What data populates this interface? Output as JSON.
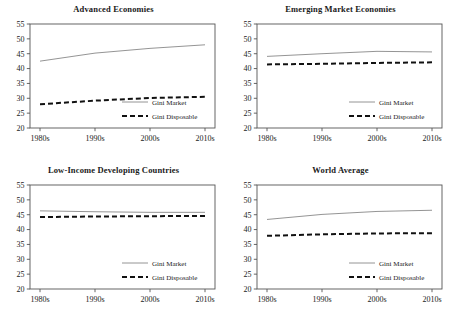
{
  "figure": {
    "panel_order": [
      "advanced",
      "emerging",
      "lowincome",
      "world"
    ]
  },
  "chart_data": [
    {
      "type": "line",
      "title": "Advanced Economies",
      "xlabel": "",
      "ylabel": "",
      "categories": [
        "1980s",
        "1990s",
        "2000s",
        "2010s"
      ],
      "x_tick_labels": [
        "1980s",
        "1990s",
        "2000s",
        "2010s"
      ],
      "y_tick_labels": [
        "20",
        "25",
        "30",
        "35",
        "40",
        "45",
        "50",
        "55"
      ],
      "ylim": [
        20,
        55
      ],
      "y_tick_step": 5,
      "grid": false,
      "legend_position": "lower-right-inside",
      "series": [
        {
          "name": "Gini Market",
          "style": "solid",
          "color": "#888888",
          "values": [
            42.5,
            45.2,
            46.8,
            48.0
          ]
        },
        {
          "name": "Gini Disposable",
          "style": "dashed",
          "color": "#111111",
          "values": [
            28.0,
            29.2,
            30.1,
            30.5
          ]
        }
      ]
    },
    {
      "type": "line",
      "title": "Emerging Market Economies",
      "xlabel": "",
      "ylabel": "",
      "categories": [
        "1980s",
        "1990s",
        "2000s",
        "2010s"
      ],
      "x_tick_labels": [
        "1980s",
        "1990s",
        "2000s",
        "2010s"
      ],
      "y_tick_labels": [
        "20",
        "25",
        "30",
        "35",
        "40",
        "45",
        "50",
        "55"
      ],
      "ylim": [
        20,
        55
      ],
      "y_tick_step": 5,
      "grid": false,
      "legend_position": "lower-right-inside",
      "series": [
        {
          "name": "Gini Market",
          "style": "solid",
          "color": "#888888",
          "values": [
            44.1,
            45.0,
            45.8,
            45.6
          ]
        },
        {
          "name": "Gini Disposable",
          "style": "dashed",
          "color": "#111111",
          "values": [
            41.4,
            41.6,
            41.9,
            42.1
          ]
        }
      ]
    },
    {
      "type": "line",
      "title": "Low-Income Developing Countries",
      "xlabel": "",
      "ylabel": "",
      "categories": [
        "1980s",
        "1990s",
        "2000s",
        "2010s"
      ],
      "x_tick_labels": [
        "1980s",
        "1990s",
        "2000s",
        "2010s"
      ],
      "y_tick_labels": [
        "20",
        "25",
        "30",
        "35",
        "40",
        "45",
        "50",
        "55"
      ],
      "ylim": [
        20,
        55
      ],
      "y_tick_step": 5,
      "grid": false,
      "legend_position": "lower-right-inside",
      "series": [
        {
          "name": "Gini Market",
          "style": "solid",
          "color": "#888888",
          "values": [
            46.3,
            46.0,
            45.8,
            45.8
          ]
        },
        {
          "name": "Gini Disposable",
          "style": "dashed",
          "color": "#111111",
          "values": [
            44.2,
            44.4,
            44.5,
            44.6
          ]
        }
      ]
    },
    {
      "type": "line",
      "title": "World Average",
      "xlabel": "",
      "ylabel": "",
      "categories": [
        "1980s",
        "1990s",
        "2000s",
        "2010s"
      ],
      "x_tick_labels": [
        "1980s",
        "1990s",
        "2000s",
        "2010s"
      ],
      "y_tick_labels": [
        "20",
        "25",
        "30",
        "35",
        "40",
        "45",
        "50",
        "55"
      ],
      "ylim": [
        20,
        55
      ],
      "y_tick_step": 5,
      "grid": false,
      "legend_position": "lower-right-inside",
      "series": [
        {
          "name": "Gini Market",
          "style": "solid",
          "color": "#888888",
          "values": [
            43.4,
            45.1,
            46.1,
            46.5
          ]
        },
        {
          "name": "Gini Disposable",
          "style": "dashed",
          "color": "#111111",
          "values": [
            37.9,
            38.4,
            38.7,
            38.8
          ]
        }
      ]
    }
  ],
  "colors": {
    "market_line": "#888888",
    "disposable_line": "#111111",
    "axis": "#555555",
    "text": "#1a1a1a",
    "background": "#ffffff"
  }
}
